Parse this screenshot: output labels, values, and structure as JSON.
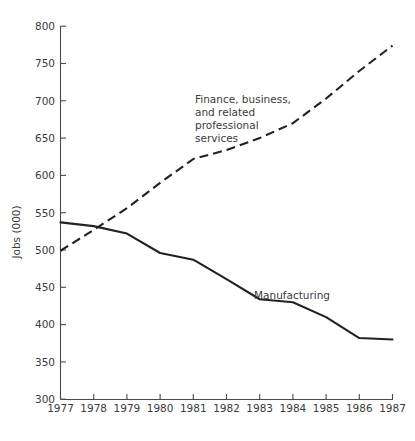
{
  "chart_data": {
    "type": "line",
    "title": "",
    "xlabel": "",
    "ylabel": "Jobs (000)",
    "xlim": [
      1977,
      1987
    ],
    "ylim": [
      300,
      800
    ],
    "grid": false,
    "legend_position": "inline-annotations",
    "x": [
      1977,
      1978,
      1979,
      1980,
      1981,
      1982,
      1983,
      1984,
      1985,
      1986,
      1987
    ],
    "x_tick_labels": [
      "1977",
      "1978",
      "1979",
      "1980",
      "1981",
      "1982",
      "1983",
      "1984",
      "1985",
      "1986",
      "1987"
    ],
    "y_ticks": [
      300,
      350,
      400,
      450,
      500,
      550,
      600,
      650,
      700,
      750,
      800
    ],
    "y_tick_labels": [
      "300",
      "350",
      "400",
      "450",
      "500",
      "550",
      "600",
      "650",
      "700",
      "750",
      "800"
    ],
    "series": [
      {
        "name": "Finance, business, and related professional services",
        "style": "dashed",
        "color": "#222222",
        "values": [
          499,
          527,
          556,
          590,
          622,
          634,
          650,
          670,
          703,
          740,
          774
        ]
      },
      {
        "name": "Manufacturing",
        "style": "solid",
        "color": "#222222",
        "values": [
          537,
          532,
          522,
          496,
          487,
          461,
          434,
          430,
          410,
          382,
          380
        ]
      }
    ],
    "annotations": [
      {
        "name": "finance-series-label",
        "lines": [
          "Finance, business,",
          "and related",
          "professional",
          "services"
        ],
        "x_px": 195,
        "y_px": 103
      },
      {
        "name": "manufacturing-series-label",
        "lines": [
          "Manufacturing"
        ],
        "x_px": 254,
        "y_px": 299
      }
    ]
  }
}
